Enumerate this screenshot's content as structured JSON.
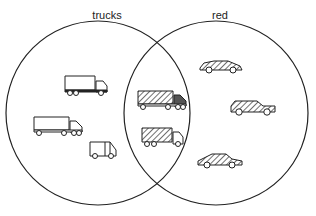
{
  "diagram": {
    "type": "venn",
    "sets": [
      {
        "id": "trucks",
        "label": "trucks",
        "cx": 98,
        "cy": 113,
        "r": 92,
        "label_x": 107,
        "label_y": 9
      },
      {
        "id": "red",
        "label": "red",
        "cx": 216,
        "cy": 113,
        "r": 92,
        "label_x": 220,
        "label_y": 9
      }
    ],
    "stroke_color": "#222222",
    "items": [
      {
        "region": "trucks-only",
        "kind": "box-truck-trailer",
        "icon": "box-truck-icon",
        "hatched": false,
        "x": 65,
        "y": 76
      },
      {
        "region": "trucks-only",
        "kind": "semi-truck",
        "icon": "semi-truck-icon",
        "hatched": false,
        "x": 34,
        "y": 117
      },
      {
        "region": "trucks-only",
        "kind": "delivery-van",
        "icon": "delivery-van-icon",
        "hatched": false,
        "x": 90,
        "y": 142
      },
      {
        "region": "both",
        "kind": "semi-truck",
        "icon": "semi-truck-icon",
        "hatched": true,
        "x": 138,
        "y": 91
      },
      {
        "region": "both",
        "kind": "box-truck",
        "icon": "box-truck-icon",
        "hatched": true,
        "x": 142,
        "y": 128
      },
      {
        "region": "red-only",
        "kind": "sports-car",
        "icon": "sports-car-icon",
        "hatched": true,
        "x": 200,
        "y": 60
      },
      {
        "region": "red-only",
        "kind": "station-wagon",
        "icon": "station-wagon-icon",
        "hatched": true,
        "x": 231,
        "y": 100
      },
      {
        "region": "red-only",
        "kind": "sedan",
        "icon": "sedan-icon",
        "hatched": true,
        "x": 198,
        "y": 153
      }
    ]
  }
}
